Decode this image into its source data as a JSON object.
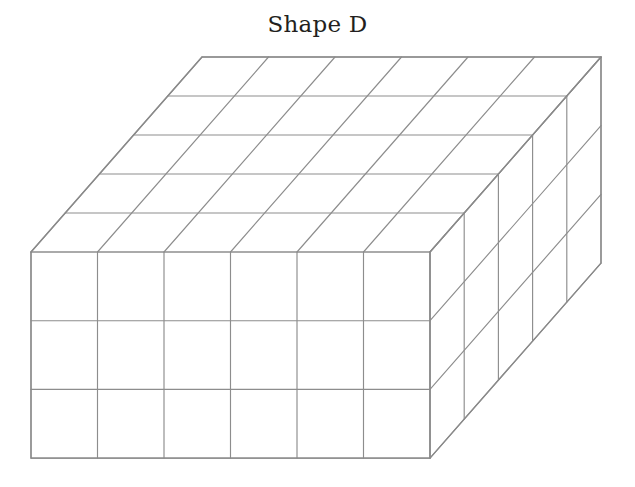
{
  "figure": {
    "title": "Shape D",
    "kind": "cube-stack-3d",
    "projection": "oblique",
    "dimensions": {
      "width_cubes": 6,
      "height_cubes": 3,
      "depth_cubes": 5,
      "total_cubes": 90
    },
    "geometry": {
      "front_top_left_x": 31,
      "front_top_left_y": 252,
      "cell_width": 66.5,
      "cell_height": 68.7,
      "depth_step_x": 34.2,
      "depth_step_y": -39.0
    },
    "colors": {
      "background": "#ffffff",
      "face_fill": "#ffffff",
      "grid_line": "#8d8d8d",
      "outline_line": "#8a8a8a",
      "title_text": "#231f20"
    },
    "stroke": {
      "grid_width": 1.15,
      "outline_width": 1.35
    }
  }
}
